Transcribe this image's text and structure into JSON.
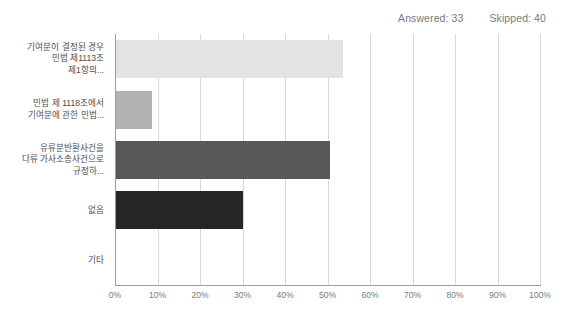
{
  "header": {
    "answered_label": "Answered: 33",
    "skipped_label": "Skipped: 40",
    "faded_title": ""
  },
  "chart_data": {
    "type": "bar",
    "orientation": "horizontal",
    "title": "",
    "xlabel": "",
    "ylabel": "",
    "xlim": [
      0,
      100
    ],
    "xtick_labels": [
      "0%",
      "10%",
      "20%",
      "30%",
      "40%",
      "50%",
      "60%",
      "70%",
      "80%",
      "90%",
      "100%"
    ],
    "xtick_values": [
      0,
      10,
      20,
      30,
      40,
      50,
      60,
      70,
      80,
      90,
      100
    ],
    "grid": true,
    "legend": "none",
    "categories": [
      "기여분이 결정된 경우\n민법 제1113조\n제1항의...",
      "민법 제 1118조에서\n기여분에 관한 민법...",
      "유류분반환사건을\n다류 가사소송사건으로\n규정하...",
      "없음",
      "기타"
    ],
    "values": [
      53.6,
      8.7,
      50.6,
      30.1,
      0
    ],
    "colors": [
      "#e3e3e3",
      "#b2b2b2",
      "#585858",
      "#262626",
      "#000000"
    ]
  }
}
